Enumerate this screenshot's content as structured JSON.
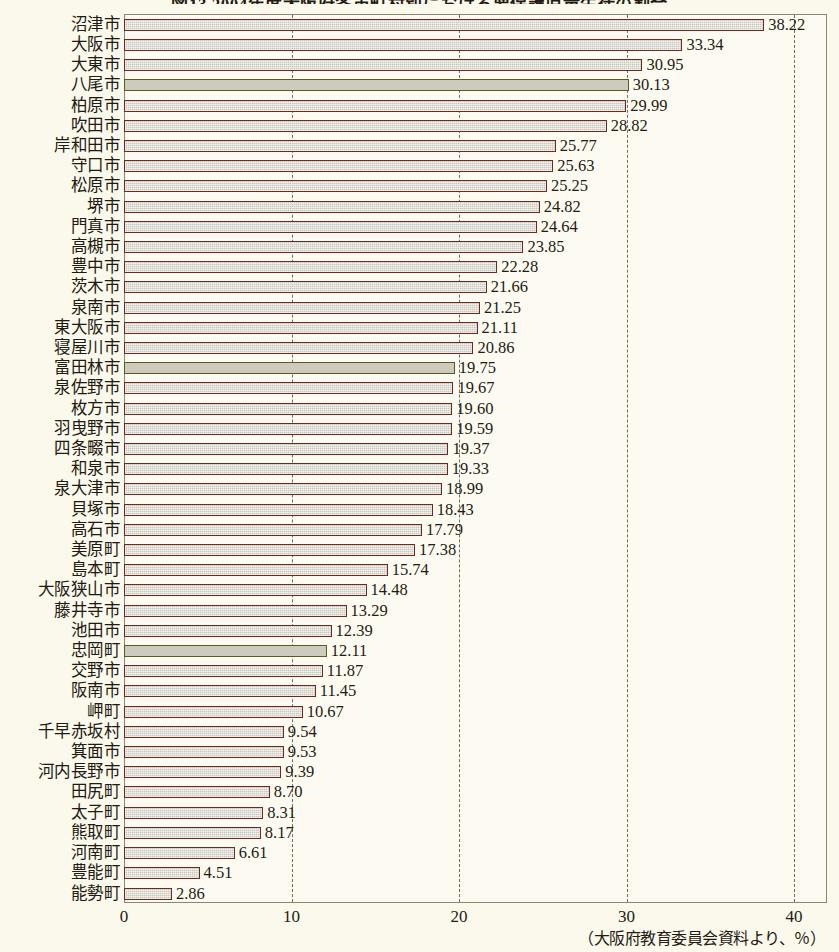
{
  "title": "図13  2004年度大阪府各市町村別における要保護児童生徒の割合",
  "footer_note": "（大阪府教育委員会資料より、％）",
  "colors": {
    "page_background": "#fbf8ec",
    "plot_background": "#fdfbf1",
    "bar_fill": "#c9c6bb",
    "bar_border": "#6d2a22",
    "bar_border_alt": "#5a5a23",
    "gridline": "#6f6a5c",
    "text": "#241c12"
  },
  "chart_data": {
    "type": "bar",
    "orientation": "horizontal",
    "title": "図13  2004年度大阪府各市町村別における要保護児童生徒の割合",
    "xlabel": "",
    "ylabel": "",
    "xlim": [
      0,
      42
    ],
    "xticks": [
      "0",
      "10",
      "20",
      "30",
      "40"
    ],
    "xtick_values": [
      0,
      10,
      20,
      30,
      40
    ],
    "grid": "vertical-dashed",
    "legend": "none",
    "unit": "％",
    "source_note": "（大阪府教育委員会資料より、％）",
    "categories": [
      "沼津市",
      "大阪市",
      "大東市",
      "八尾市",
      "柏原市",
      "吹田市",
      "岸和田市",
      "守口市",
      "松原市",
      "堺市",
      "門真市",
      "高槻市",
      "豊中市",
      "茨木市",
      "泉南市",
      "東大阪市",
      "寝屋川市",
      "富田林市",
      "泉佐野市",
      "枚方市",
      "羽曳野市",
      "四条畷市",
      "和泉市",
      "泉大津市",
      "貝塚市",
      "高石市",
      "美原町",
      "島本町",
      "大阪狭山市",
      "藤井寺市",
      "池田市",
      "忠岡町",
      "交野市",
      "阪南市",
      "岬町",
      "千早赤坂村",
      "箕面市",
      "河内長野市",
      "田尻町",
      "太子町",
      "熊取町",
      "河南町",
      "豊能町",
      "能勢町"
    ],
    "values": [
      38.22,
      33.34,
      30.95,
      30.13,
      29.99,
      28.82,
      25.77,
      25.63,
      25.25,
      24.82,
      24.64,
      23.85,
      22.28,
      21.66,
      21.25,
      21.11,
      20.86,
      19.75,
      19.67,
      19.6,
      19.59,
      19.37,
      19.33,
      18.99,
      18.43,
      17.79,
      17.38,
      15.74,
      14.48,
      13.29,
      12.39,
      12.11,
      11.87,
      11.45,
      10.67,
      9.54,
      9.53,
      9.39,
      8.7,
      8.31,
      8.17,
      6.61,
      4.51,
      2.86
    ],
    "value_labels": [
      "38.22",
      "33.34",
      "30.95",
      "30.13",
      "29.99",
      "28.82",
      "25.77",
      "25.63",
      "25.25",
      "24.82",
      "24.64",
      "23.85",
      "22.28",
      "21.66",
      "21.25",
      "21.11",
      "20.86",
      "19.75",
      "19.67",
      "19.60",
      "19.59",
      "19.37",
      "19.33",
      "18.99",
      "18.43",
      "17.79",
      "17.38",
      "15.74",
      "14.48",
      "13.29",
      "12.39",
      "12.11",
      "11.87",
      "11.45",
      "10.67",
      "9.54",
      "9.53",
      "9.39",
      "8.70",
      "8.31",
      "8.17",
      "6.61",
      "4.51",
      "2.86"
    ],
    "highlight_indices": [
      3,
      17,
      31
    ]
  }
}
